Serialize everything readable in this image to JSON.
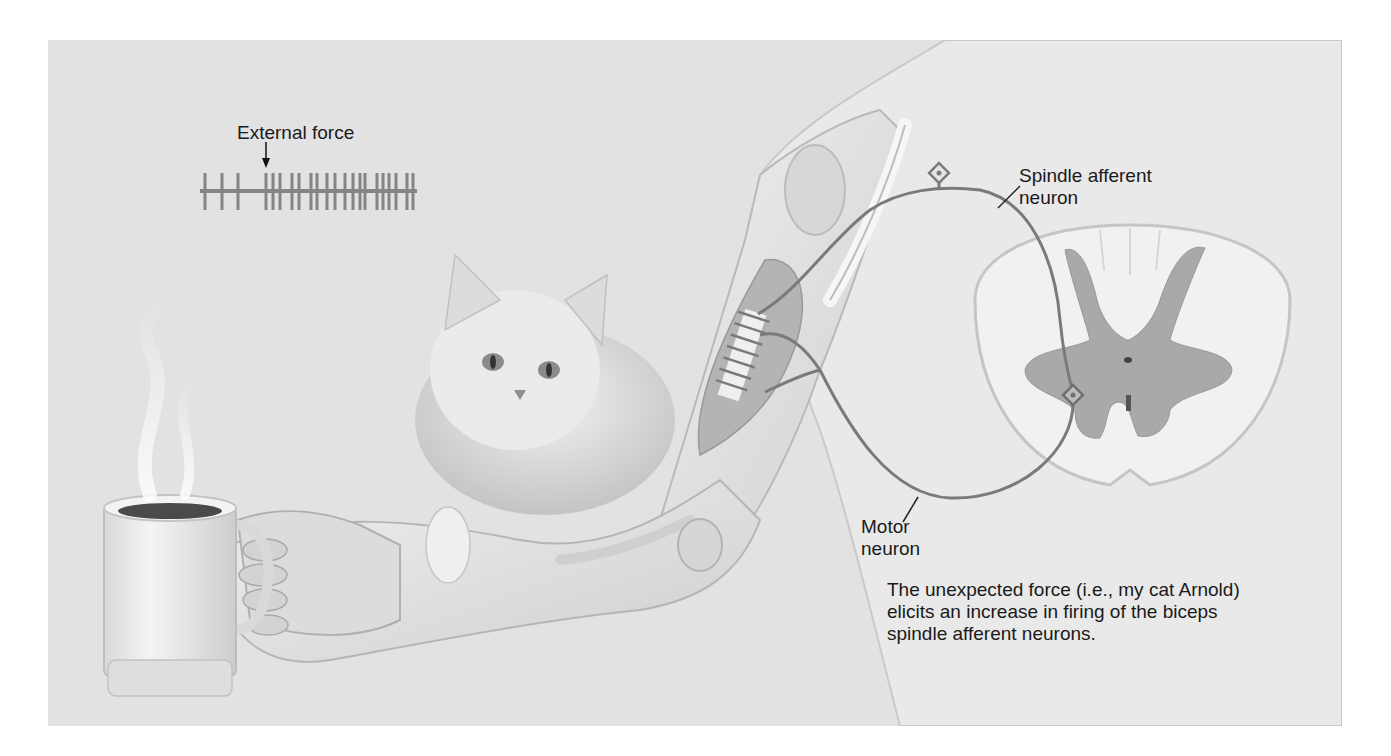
{
  "figure": {
    "background": "#e2e2e2",
    "neuron_color": "#7a7a7a",
    "muscle_color": "#b4b4b4",
    "gray_matter_color": "#a9a9a9"
  },
  "labels": {
    "external_force": "External force",
    "spindle_afferent_line1": "Spindle afferent",
    "spindle_afferent_line2": "neuron",
    "motor_neuron_line1": "Motor",
    "motor_neuron_line2": "neuron"
  },
  "caption": {
    "line1": "The unexpected force (i.e., my cat Arnold)",
    "line2": "elicits an increase in firing of the biceps",
    "line3": "spindle afferent neurons."
  },
  "spike_train": {
    "baseline": {
      "x1": 200,
      "x2": 417,
      "y": 191
    },
    "arrow_x": 266,
    "spikes_x": [
      205,
      222,
      238,
      266,
      273,
      280,
      292,
      299,
      311,
      317,
      327,
      335,
      345,
      353,
      360,
      365,
      377,
      383,
      389,
      396,
      407,
      413
    ]
  }
}
